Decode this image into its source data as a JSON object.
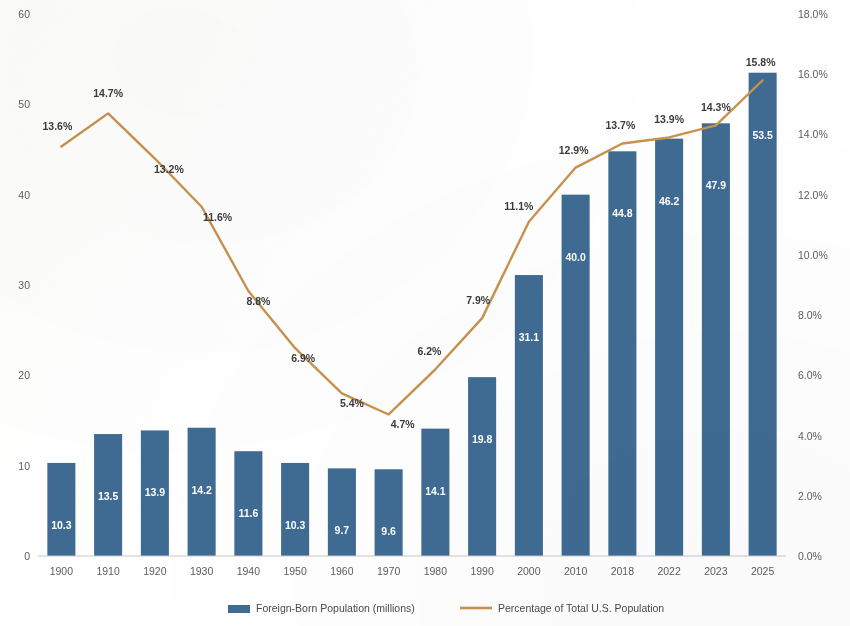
{
  "chart_data": {
    "type": "bar",
    "title": "",
    "subtitle": "",
    "xlabel": "",
    "ylabel": "",
    "y2label": "",
    "categories": [
      "1900",
      "1910",
      "1920",
      "1930",
      "1940",
      "1950",
      "1960",
      "1970",
      "1980",
      "1990",
      "2000",
      "2010",
      "2018",
      "2022",
      "2023",
      "2025"
    ],
    "series": [
      {
        "name": "Foreign-Born Population (millions)",
        "type": "bar",
        "axis": "left",
        "color": "#3f6b93",
        "values": [
          10.3,
          13.5,
          13.9,
          14.2,
          11.6,
          10.3,
          9.7,
          9.6,
          14.1,
          19.8,
          31.1,
          40.0,
          44.8,
          46.2,
          47.9,
          53.5
        ],
        "value_labels": [
          "10.3",
          "13.5",
          "13.9",
          "14.2",
          "11.6",
          "10.3",
          "9.7",
          "9.6",
          "14.1",
          "19.8",
          "31.1",
          "40.0",
          "44.8",
          "46.2",
          "47.9",
          "53.5"
        ]
      },
      {
        "name": "Percentage of Total U.S. Population",
        "type": "line",
        "axis": "right",
        "color": "#c8924e",
        "values": [
          13.6,
          14.7,
          13.2,
          11.6,
          8.8,
          6.9,
          5.4,
          4.7,
          6.2,
          7.9,
          11.1,
          12.9,
          13.7,
          13.9,
          14.3,
          15.8
        ],
        "value_labels": [
          "13.6%",
          "14.7%",
          "13.2%",
          "11.6%",
          "8.8%",
          "6.9%",
          "5.4%",
          "4.7%",
          "6.2%",
          "7.9%",
          "11.1%",
          "12.9%",
          "13.7%",
          "13.9%",
          "14.3%",
          "15.8%"
        ]
      }
    ],
    "ylim": [
      0,
      60
    ],
    "yticks": [
      0,
      10,
      20,
      30,
      40,
      50,
      60
    ],
    "ytick_labels": [
      "0",
      "10",
      "20",
      "30",
      "40",
      "50",
      "60"
    ],
    "y2lim": [
      0,
      18
    ],
    "y2ticks": [
      0,
      2,
      4,
      6,
      8,
      10,
      12,
      14,
      16,
      18
    ],
    "y2tick_labels": [
      "0.0%",
      "2.0%",
      "4.0%",
      "6.0%",
      "8.0%",
      "10.0%",
      "12.0%",
      "14.0%",
      "16.0%",
      "18.0%"
    ],
    "grid": false,
    "legend_position": "bottom",
    "legend": [
      {
        "label": "Foreign-Born Population (millions)",
        "marker": "square",
        "color": "#3f6b93"
      },
      {
        "label": "Percentage of Total U.S. Population",
        "marker": "line",
        "color": "#c8924e"
      }
    ]
  }
}
